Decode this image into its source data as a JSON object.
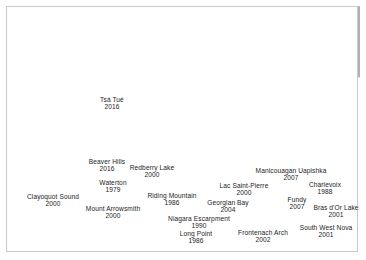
{
  "figure": {
    "title": "",
    "type": "map",
    "region": "Canada",
    "theme": "UNESCO Biosphere Reserves in Canada"
  },
  "colors": {
    "land": "#b0b0b0",
    "water": "#ffffff",
    "reserve_fill": "#6e6e6e",
    "reserve_stroke": "#3a3a3a",
    "province_border": "#9a9a9a",
    "label_text": "#1c1c1c",
    "frame_border": "#c9c9c9",
    "background": "#ffffff"
  },
  "map": {
    "reserves": [
      {
        "id": "tsa-tue",
        "name": "Tsá Tué",
        "year": "2016",
        "label_x": 112,
        "label_y": 103,
        "marker_x": 99,
        "marker_y": 96,
        "leader": false
      },
      {
        "id": "beaver-hills",
        "name": "Beaver Hills",
        "year": "2016",
        "label_x": 107,
        "label_y": 165,
        "marker_x": 122,
        "marker_y": 174,
        "leader": false
      },
      {
        "id": "redberry-lake",
        "name": "Redberry Lake",
        "year": "2000",
        "label_x": 152,
        "label_y": 171,
        "marker_x": 139,
        "marker_y": 180,
        "leader": false
      },
      {
        "id": "waterton",
        "name": "Waterton",
        "year": "1979",
        "label_x": 113,
        "label_y": 186,
        "marker_x": 117,
        "marker_y": 200,
        "leader": false
      },
      {
        "id": "clayoquot-sound",
        "name": "Clayoquot Sound",
        "year": "2000",
        "label_x": 53,
        "label_y": 200,
        "marker_x": 79,
        "marker_y": 208,
        "leader": true
      },
      {
        "id": "mount-arrowsmith",
        "name": "Mount Arrowsmith",
        "year": "2000",
        "label_x": 113,
        "label_y": 212,
        "marker_x": 84,
        "marker_y": 211,
        "leader": true
      },
      {
        "id": "riding-mountain",
        "name": "Riding Mountain",
        "year": "1986",
        "label_x": 172,
        "label_y": 199,
        "marker_x": 170,
        "marker_y": 192,
        "leader": false
      },
      {
        "id": "niagara-escarpment",
        "name": "Niagara Escarpment",
        "year": "1990",
        "label_x": 199,
        "label_y": 222,
        "marker_x": 222,
        "marker_y": 229,
        "leader": true
      },
      {
        "id": "long-point",
        "name": "Long Point",
        "year": "1986",
        "label_x": 196,
        "label_y": 237,
        "marker_x": 228,
        "marker_y": 233,
        "leader": true
      },
      {
        "id": "georgian-bay",
        "name": "Georgian Bay",
        "year": "2004",
        "label_x": 228,
        "label_y": 206,
        "marker_x": 235,
        "marker_y": 222,
        "leader": true
      },
      {
        "id": "lac-saint-pierre",
        "name": "Lac Saint-Pierre",
        "year": "2000",
        "label_x": 244,
        "label_y": 189,
        "marker_x": 266,
        "marker_y": 219,
        "leader": true
      },
      {
        "id": "manicouagan",
        "name": "Manicouagan Uapishka",
        "year": "2007",
        "label_x": 291,
        "label_y": 174,
        "marker_x": 297,
        "marker_y": 203,
        "leader": true
      },
      {
        "id": "charlevoix",
        "name": "Charlevoix",
        "year": "1988",
        "label_x": 325,
        "label_y": 188,
        "marker_x": 288,
        "marker_y": 206,
        "leader": true
      },
      {
        "id": "fundy",
        "name": "Fundy",
        "year": "2007",
        "label_x": 297,
        "label_y": 203,
        "marker_x": 304,
        "marker_y": 213,
        "leader": false
      },
      {
        "id": "bras-dor-lake",
        "name": "Bras d'Or Lake",
        "year": "2001",
        "label_x": 336,
        "label_y": 211,
        "marker_x": 322,
        "marker_y": 218,
        "leader": false
      },
      {
        "id": "frontenach-arch",
        "name": "Frontenach Arch",
        "year": "2002",
        "label_x": 263,
        "label_y": 236,
        "marker_x": 250,
        "marker_y": 226,
        "leader": true
      },
      {
        "id": "south-west-nova",
        "name": "South West Nova",
        "year": "2001",
        "label_x": 326,
        "label_y": 231,
        "marker_x": 312,
        "marker_y": 222,
        "leader": true
      }
    ]
  }
}
